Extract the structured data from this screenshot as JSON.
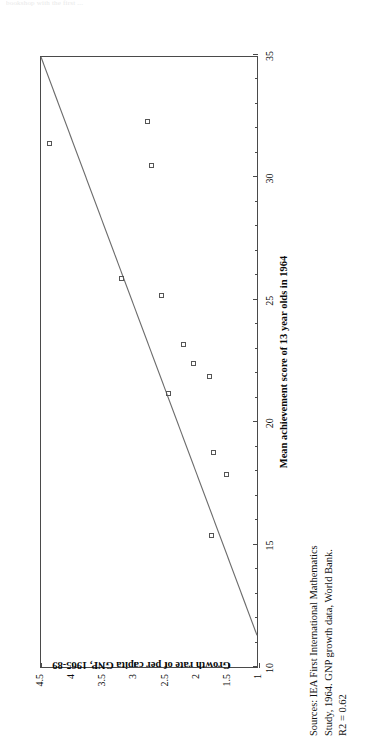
{
  "clipped_header": "bookshop with the first ...",
  "chart_data": {
    "type": "scatter",
    "title": "",
    "xlabel": "Mean achievement score of 13 year olds in 1964",
    "ylabel": "Growth rate of per capita GNP, 1965-89",
    "xlim": [
      10,
      35
    ],
    "ylim": [
      1,
      4.5
    ],
    "xticks": [
      10,
      15,
      20,
      25,
      30,
      35
    ],
    "xticklabels": [
      "10",
      "15",
      "20",
      "25",
      "30",
      "35"
    ],
    "yticks": [
      1,
      1.5,
      2,
      2.5,
      3,
      3.5,
      4,
      4.5
    ],
    "yticklabels": [
      "1",
      "1.5",
      "2",
      "2.5",
      "3",
      "3.5",
      "4",
      "4.5"
    ],
    "grid": false,
    "legend": false,
    "marker": "open-square",
    "points": [
      {
        "x": 31.4,
        "y": 4.35
      },
      {
        "x": 32.3,
        "y": 2.78
      },
      {
        "x": 30.5,
        "y": 2.72
      },
      {
        "x": 25.9,
        "y": 3.2
      },
      {
        "x": 25.2,
        "y": 2.55
      },
      {
        "x": 23.2,
        "y": 2.2
      },
      {
        "x": 22.4,
        "y": 2.05
      },
      {
        "x": 21.9,
        "y": 1.78
      },
      {
        "x": 21.2,
        "y": 2.45
      },
      {
        "x": 18.8,
        "y": 1.72
      },
      {
        "x": 17.9,
        "y": 1.52
      },
      {
        "x": 15.4,
        "y": 1.75
      },
      {
        "x": 21.2,
        "y": 2.45
      }
    ],
    "fit_line": {
      "type": "linear-regression",
      "x_start": 11.3,
      "y_start": 1.0,
      "x_end": 35.0,
      "y_end": 4.5,
      "r2_label": "R2 = 0.62"
    }
  },
  "sources": {
    "line1": "Sources: IEA First International Mathematics",
    "line2": "Study, 1964.  GNP growth data, World Bank.",
    "line3": "R2 = 0.62"
  }
}
